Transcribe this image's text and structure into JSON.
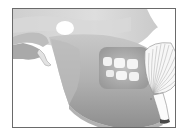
{
  "illustration": {
    "subject": "mandible with chin implant",
    "parts": [
      "skull-base",
      "mandible",
      "teeth",
      "zygomatic-arch",
      "chin-implant",
      "chin-implant-tab"
    ],
    "colors": {
      "frame": "#6a6a6a",
      "bone_light": "#d6d6d6",
      "bone_mid": "#b4b4b4",
      "bone_dark": "#8c8c8c",
      "teeth": "#f4f4f4",
      "implant": "#f7f7f7",
      "implant_lines": "#9a9a9a",
      "background": "#ffffff"
    }
  }
}
